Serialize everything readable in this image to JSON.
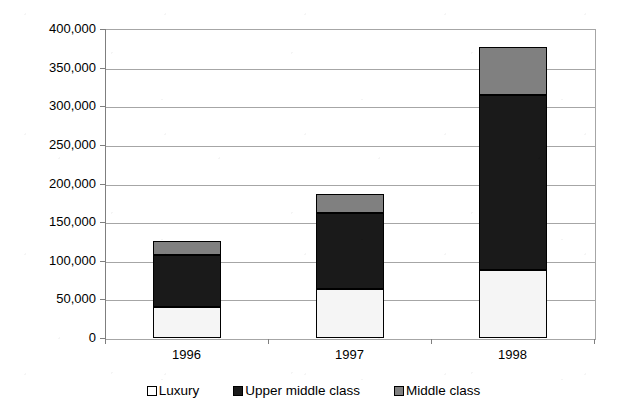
{
  "chart_data": {
    "type": "bar",
    "subtype": "stacked-column",
    "title": "",
    "xlabel": "",
    "ylabel": "",
    "categories": [
      "1996",
      "1997",
      "1998"
    ],
    "series": [
      {
        "name": "Luxury",
        "color": "#ffffff",
        "values": [
          40000,
          63000,
          88000
        ]
      },
      {
        "name": "Upper middle class",
        "color": "#1a1a1a",
        "values": [
          67000,
          99000,
          226000
        ]
      },
      {
        "name": "Middle class",
        "color": "#808080",
        "values": [
          18000,
          24000,
          63000
        ]
      }
    ],
    "totals": [
      125000,
      186000,
      377000
    ],
    "ylim": [
      0,
      400000
    ],
    "ytick_values": [
      0,
      50000,
      100000,
      150000,
      200000,
      250000,
      300000,
      350000,
      400000
    ],
    "ytick_labels": [
      "0",
      "50,000",
      "100,000",
      "150,000",
      "200,000",
      "250,000",
      "300,000",
      "350,000",
      "400,000"
    ],
    "grid": true,
    "legend_position": "bottom"
  },
  "legend": {
    "items": [
      {
        "label": "Luxury",
        "swatch": "legend-swatch-luxury"
      },
      {
        "label": "Upper middle class",
        "swatch": "legend-swatch-upper-middle-class"
      },
      {
        "label": "Middle class",
        "swatch": "legend-swatch-middle-class"
      }
    ]
  },
  "colors": {
    "luxury": "#ffffff",
    "upper_middle_class": "#1a1a1a",
    "middle_class": "#808080",
    "gridline": "#a6a6a6",
    "axis": "#7f7f7f",
    "background": "#ffffff"
  }
}
